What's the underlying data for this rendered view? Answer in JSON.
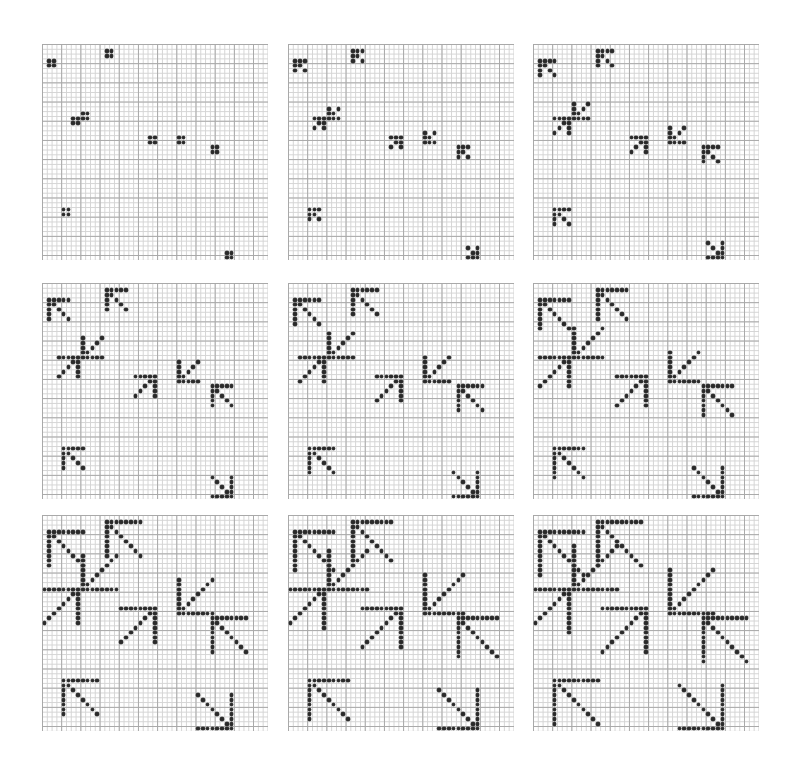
{
  "figure": {
    "colors": {
      "background": "#ffffff",
      "grid_minor": "#d4d4d4",
      "grid_major": "#a8a8a8",
      "dot": "#2a2a2a"
    },
    "grid": {
      "cols": 47,
      "rows": 45,
      "cell_px": 4.8,
      "major_every": 4
    },
    "panel_layout": {
      "col_x": [
        42,
        288,
        533
      ],
      "row_y": [
        44,
        283,
        515
      ]
    },
    "shapes": [
      {
        "id": 1,
        "orientation": "NW",
        "corner": [
          1,
          3
        ]
      },
      {
        "id": 2,
        "orientation": "NW",
        "corner": [
          13,
          1
        ]
      },
      {
        "id": 3,
        "orientation": "SW",
        "corner": [
          8,
          15
        ]
      },
      {
        "id": 4,
        "orientation": "NE",
        "corner": [
          7,
          15
        ]
      },
      {
        "id": 5,
        "orientation": "NE",
        "corner": [
          23,
          19
        ]
      },
      {
        "id": 6,
        "orientation": "SW",
        "corner": [
          28,
          20
        ]
      },
      {
        "id": 7,
        "orientation": "NW",
        "corner": [
          35,
          21
        ]
      },
      {
        "id": 8,
        "orientation": "NW",
        "corner": [
          4,
          34
        ]
      },
      {
        "id": 9,
        "orientation": "SE",
        "corner": [
          39,
          44
        ]
      }
    ],
    "panels": [
      {
        "label": "generation-1",
        "arm_length": 2
      },
      {
        "label": "generation-2",
        "arm_length": 3
      },
      {
        "label": "generation-3",
        "arm_length": 4
      },
      {
        "label": "generation-4",
        "arm_length": 5
      },
      {
        "label": "generation-5",
        "arm_length": 6
      },
      {
        "label": "generation-6",
        "arm_length": 7
      },
      {
        "label": "generation-7",
        "arm_length": 8
      },
      {
        "label": "generation-8",
        "arm_length": 9
      },
      {
        "label": "generation-9",
        "arm_length": 10
      }
    ]
  }
}
